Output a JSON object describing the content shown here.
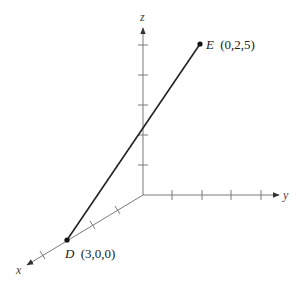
{
  "diagram": {
    "type": "3d-coordinate-axes",
    "axes": {
      "x": {
        "label": "x",
        "ticks": 4
      },
      "y": {
        "label": "y",
        "ticks": 4
      },
      "z": {
        "label": "z",
        "ticks": 5
      }
    },
    "points": [
      {
        "name": "D",
        "coords": "(3,0,0)"
      },
      {
        "name": "E",
        "coords": "(0,2,5)"
      }
    ],
    "segment": {
      "from": "D",
      "to": "E"
    }
  }
}
